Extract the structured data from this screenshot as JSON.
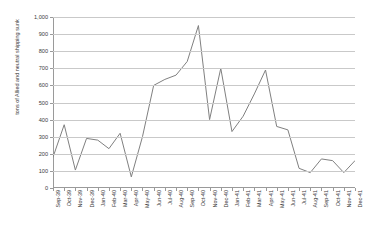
{
  "chart_data": {
    "type": "line",
    "title": "",
    "xlabel": "",
    "ylabel": "tons of Allied and neutral shipping sunk",
    "ylim": [
      0,
      1000
    ],
    "ytick_step": 100,
    "ytick_labels": [
      "1,000",
      "900",
      "800",
      "700",
      "600",
      "500",
      "400",
      "300",
      "200",
      "100",
      "0"
    ],
    "ytick_values": [
      1000,
      900,
      800,
      700,
      600,
      500,
      400,
      300,
      200,
      100,
      0
    ],
    "grid": true,
    "legend": "none",
    "line_color": "#808080",
    "grid_color": "#c9c9c9",
    "axis_color": "#9a9a9a",
    "categories": [
      "Sep-39",
      "Oct-39",
      "Nov-39",
      "Dec-39",
      "Jan-40",
      "Feb-40",
      "Mar-40",
      "Apr-40",
      "May-40",
      "Jun-40",
      "Jul-40",
      "Aug-40",
      "Sep-40",
      "Oct-40",
      "Nov-40",
      "Dec-40",
      "Jan-41",
      "Feb-41",
      "Mar-41",
      "Apr-41",
      "May-41",
      "Jun-41",
      "Jul-41",
      "Aug-41",
      "Sep-41",
      "Oct-41",
      "Nov-41",
      "Dec-41"
    ],
    "values": [
      180,
      370,
      105,
      290,
      280,
      230,
      320,
      65,
      300,
      600,
      635,
      660,
      740,
      950,
      400,
      700,
      330,
      420,
      550,
      690,
      360,
      340,
      115,
      90,
      170,
      160,
      90,
      160
    ]
  }
}
